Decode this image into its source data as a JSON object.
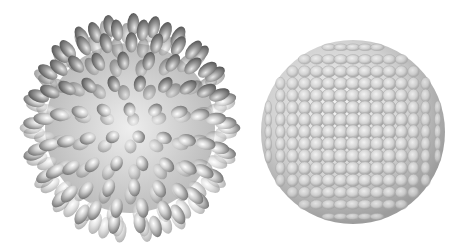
{
  "scene": {
    "background": "#ffffff",
    "objects": [
      {
        "name": "spiky-ellipsoid-sphere",
        "cx": 130,
        "cy": 128,
        "r": 108,
        "color": "#b8b8b8"
      },
      {
        "name": "packed-ellipsoid-sphere",
        "cx": 353,
        "cy": 132,
        "r": 92,
        "color": "#d0d0d0"
      }
    ]
  }
}
